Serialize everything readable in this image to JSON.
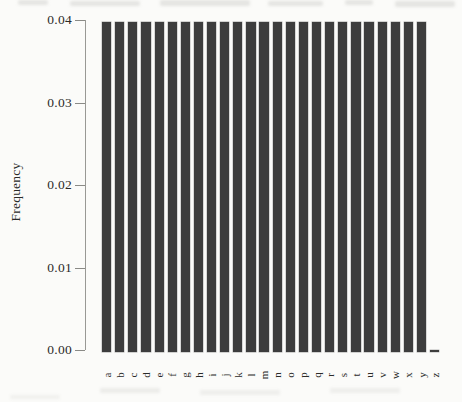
{
  "chart_data": {
    "type": "bar",
    "title": "",
    "xlabel": "",
    "ylabel": "Frequency",
    "categories": [
      "a",
      "b",
      "c",
      "d",
      "e",
      "f",
      "g",
      "h",
      "i",
      "j",
      "k",
      "l",
      "m",
      "n",
      "o",
      "p",
      "q",
      "r",
      "s",
      "t",
      "u",
      "v",
      "w",
      "x",
      "y",
      "z"
    ],
    "values": [
      0.04,
      0.04,
      0.04,
      0.04,
      0.04,
      0.04,
      0.04,
      0.04,
      0.04,
      0.04,
      0.04,
      0.04,
      0.04,
      0.04,
      0.04,
      0.04,
      0.04,
      0.04,
      0.04,
      0.04,
      0.04,
      0.04,
      0.04,
      0.04,
      0.04,
      0
    ],
    "ylim": [
      0,
      0.04
    ],
    "ytick_values": [
      0,
      0.01,
      0.02,
      0.03,
      0.04
    ],
    "ytick_labels": [
      "0.00",
      "0.01",
      "0.02",
      "0.03",
      "0.04"
    ],
    "grid": "off",
    "legend": "none",
    "bar_color": "#3d3d3d",
    "axis_color": "#999995",
    "text_color": "#2b2b29",
    "background_color": "#fbfbf9"
  }
}
